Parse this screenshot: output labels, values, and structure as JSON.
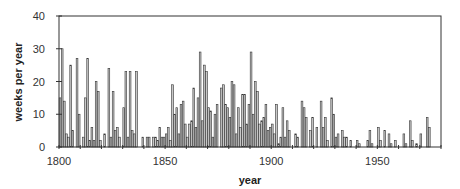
{
  "chart_data": {
    "type": "bar",
    "title": "",
    "xlabel": "year",
    "ylabel": "weeks per year",
    "xlim": [
      1800,
      1980
    ],
    "ylim": [
      0,
      40
    ],
    "x_ticks": [
      1800,
      1850,
      1900,
      1950
    ],
    "y_ticks": [
      0,
      10,
      20,
      30,
      40
    ],
    "grid": false,
    "legend": null,
    "bar_fill": "#c8c8c8",
    "bar_stroke": "#333333",
    "x": [
      1800,
      1801,
      1802,
      1803,
      1804,
      1805,
      1806,
      1807,
      1808,
      1809,
      1810,
      1811,
      1812,
      1813,
      1814,
      1815,
      1816,
      1817,
      1818,
      1819,
      1820,
      1821,
      1822,
      1823,
      1824,
      1825,
      1826,
      1827,
      1828,
      1829,
      1830,
      1831,
      1832,
      1833,
      1834,
      1835,
      1836,
      1837,
      1838,
      1839,
      1840,
      1841,
      1842,
      1843,
      1844,
      1845,
      1846,
      1847,
      1848,
      1849,
      1850,
      1851,
      1852,
      1853,
      1854,
      1855,
      1856,
      1857,
      1858,
      1859,
      1860,
      1861,
      1862,
      1863,
      1864,
      1865,
      1866,
      1867,
      1868,
      1869,
      1870,
      1871,
      1872,
      1873,
      1874,
      1875,
      1876,
      1877,
      1878,
      1879,
      1880,
      1881,
      1882,
      1883,
      1884,
      1885,
      1886,
      1887,
      1888,
      1889,
      1890,
      1891,
      1892,
      1893,
      1894,
      1895,
      1896,
      1897,
      1898,
      1899,
      1900,
      1901,
      1902,
      1903,
      1904,
      1905,
      1906,
      1907,
      1908,
      1909,
      1910,
      1911,
      1912,
      1913,
      1914,
      1915,
      1916,
      1917,
      1918,
      1919,
      1920,
      1921,
      1922,
      1923,
      1924,
      1925,
      1926,
      1927,
      1928,
      1929,
      1930,
      1931,
      1932,
      1933,
      1934,
      1935,
      1936,
      1937,
      1938,
      1939,
      1940,
      1941,
      1942,
      1943,
      1944,
      1945,
      1946,
      1947,
      1948,
      1949,
      1950,
      1951,
      1952,
      1953,
      1954,
      1955,
      1956,
      1957,
      1958,
      1959,
      1960,
      1961,
      1962,
      1963,
      1964,
      1965,
      1966,
      1967,
      1968,
      1969,
      1970,
      1971,
      1972,
      1973,
      1974,
      1975,
      1976,
      1977
    ],
    "values": [
      15,
      30,
      14,
      4,
      3,
      25,
      5,
      0,
      27,
      10,
      0,
      3,
      15,
      27,
      2,
      6,
      2,
      20,
      17,
      2,
      0,
      4,
      0,
      24,
      3,
      17,
      5,
      6,
      3,
      0,
      12,
      23,
      3,
      23,
      5,
      4,
      23,
      0,
      0,
      3,
      0,
      3,
      3,
      0,
      3,
      3,
      2,
      6,
      3,
      3,
      4,
      6,
      2,
      19,
      10,
      12,
      4,
      13,
      14,
      7,
      3,
      7,
      8,
      18,
      6,
      15,
      29,
      8,
      25,
      23,
      12,
      11,
      3,
      10,
      13,
      0,
      18,
      19,
      13,
      12,
      9,
      20,
      19,
      4,
      12,
      6,
      16,
      16,
      7,
      13,
      29,
      10,
      20,
      17,
      7,
      8,
      9,
      13,
      5,
      6,
      7,
      4,
      13,
      1,
      3,
      12,
      3,
      8,
      5,
      0,
      0,
      4,
      3,
      0,
      14,
      12,
      9,
      0,
      5,
      9,
      0,
      6,
      0,
      14,
      6,
      9,
      2,
      0,
      15,
      10,
      3,
      4,
      0,
      5,
      3,
      3,
      0,
      2,
      0,
      0,
      2,
      1,
      0,
      0,
      0,
      2,
      5,
      1,
      0,
      0,
      6,
      2,
      0,
      5,
      0,
      4,
      1,
      0,
      2,
      0,
      0,
      0,
      4,
      1,
      0,
      8,
      2,
      0,
      1,
      0,
      4,
      0,
      0,
      9,
      6,
      0,
      0,
      0
    ]
  },
  "axes": {
    "xlabel": "year",
    "ylabel": "weeks per year",
    "x_tick_labels": [
      "1800",
      "1850",
      "1900",
      "1950"
    ],
    "y_tick_labels": [
      "0",
      "10",
      "20",
      "30",
      "40"
    ]
  }
}
